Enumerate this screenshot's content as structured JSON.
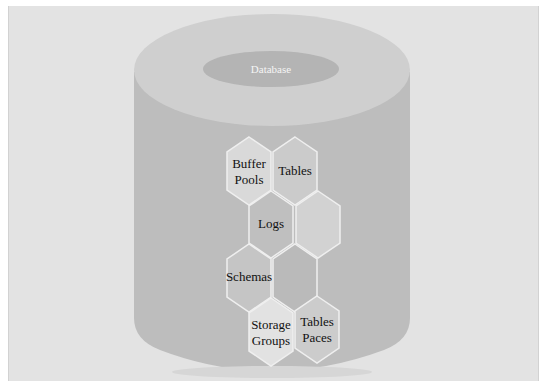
{
  "diagram": {
    "title": "Database",
    "colors": {
      "background": "#e3e3e3",
      "cylinder_body": "#bdbdbd",
      "cylinder_top": "#cfcfcf",
      "inner_ellipse": "#b4b4b4",
      "hex_stroke": "#efefef"
    },
    "components": [
      {
        "id": "buffer-pools",
        "lines": [
          "Buffer",
          "Pools"
        ],
        "fill": "#d9d9d9"
      },
      {
        "id": "tables",
        "lines": [
          "Tables"
        ],
        "fill": "#cbcbcb"
      },
      {
        "id": "logs",
        "lines": [
          "Logs"
        ],
        "fill": "#bfbfbf"
      },
      {
        "id": "empty-1",
        "lines": [],
        "fill": "#d2d2d2"
      },
      {
        "id": "schemas",
        "lines": [
          "Schemas"
        ],
        "fill": "#c5c5c5"
      },
      {
        "id": "empty-2",
        "lines": [],
        "fill": "#bababa"
      },
      {
        "id": "storage-groups",
        "lines": [
          "Storage",
          "Groups"
        ],
        "fill": "#e2e2e2"
      },
      {
        "id": "tables-paces",
        "lines": [
          "Tables",
          "Paces"
        ],
        "fill": "#cccccc"
      }
    ]
  }
}
